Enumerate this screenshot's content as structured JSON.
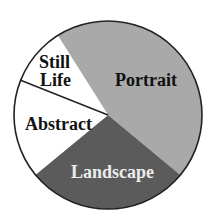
{
  "chart_data": {
    "type": "pie",
    "title": "",
    "start_angle_deg": 327.7,
    "direction": "clockwise",
    "categories": [
      "Portrait",
      "Landscape",
      "Abstract",
      "Still Life"
    ],
    "values": [
      45,
      28,
      17,
      10
    ],
    "unit": "percent (estimated from slice angles)",
    "colors": [
      "#a9a9a9",
      "#5b5b5b",
      "#ffffff",
      "#ffffff"
    ],
    "label_colors": [
      "#111111",
      "#ececec",
      "#111111",
      "#111111"
    ],
    "labels": {
      "portrait": "Portrait",
      "landscape": "Landscape",
      "abstract": "Abstract",
      "still_life_line1": "Still",
      "still_life_line2": "Life"
    },
    "legend": "none (labels drawn inside slices)",
    "outline_color": "#222222"
  }
}
